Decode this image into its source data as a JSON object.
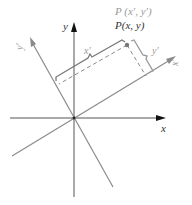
{
  "diagram": {
    "labels": {
      "x_axis": "x",
      "y_axis": "y",
      "x_prime_axis": "x′",
      "y_prime_axis": "y′",
      "point_prime": "P (x′, y′)",
      "point": "P(x, y)",
      "x_prime_brace": "x′",
      "y_prime_brace": "y′"
    },
    "colors": {
      "main_axes": "#555555",
      "rotated_axes": "#8a8a8a",
      "arrow": "#111111",
      "dashed": "#8a8a8a",
      "point": "#777777",
      "label_dark": "#333333",
      "label_light": "#999999"
    }
  }
}
